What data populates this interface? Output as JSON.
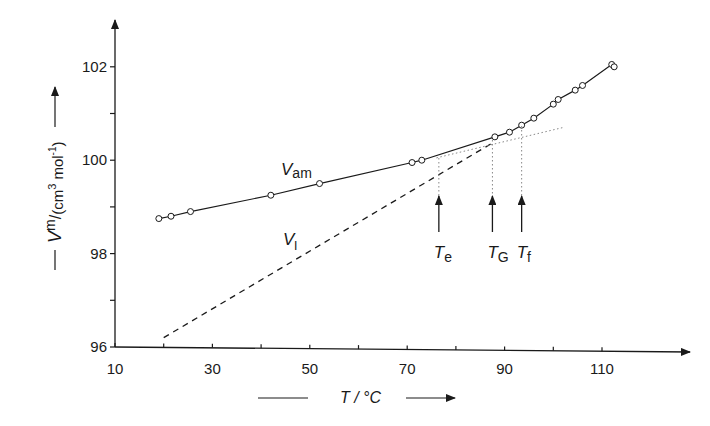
{
  "chart_data": {
    "type": "line",
    "title": "",
    "xlabel": "T / °C",
    "ylabel": "V m / (cm3 mol-1)",
    "xlim": [
      10,
      125
    ],
    "ylim": [
      96,
      103
    ],
    "x_ticks": [
      10,
      20,
      30,
      40,
      50,
      60,
      70,
      80,
      90,
      100,
      110
    ],
    "x_tick_labels": [
      "10",
      "30",
      "50",
      "70",
      "90",
      "110"
    ],
    "y_ticks": [
      96,
      97,
      98,
      99,
      100,
      101,
      102
    ],
    "y_tick_labels": [
      "96",
      "98",
      "100",
      "102"
    ],
    "grid": false,
    "series": [
      {
        "name": "V_am",
        "label": "V",
        "label_sub": "am",
        "style": "solid-with-markers",
        "x": [
          19,
          21.5,
          25.5,
          42,
          52,
          71,
          73,
          88,
          91,
          93.5,
          96,
          100,
          101,
          104.5,
          106,
          112,
          112.5
        ],
        "y": [
          98.75,
          98.8,
          98.9,
          99.25,
          99.5,
          99.95,
          100.0,
          100.5,
          100.6,
          100.75,
          100.9,
          101.2,
          101.3,
          101.5,
          101.6,
          102.05,
          102.0
        ]
      },
      {
        "name": "V_l",
        "label": "V",
        "label_sub": "l",
        "style": "dashed",
        "x": [
          20,
          88
        ],
        "y": [
          96.2,
          100.4
        ]
      },
      {
        "name": "glass-extrapolation",
        "style": "dotted",
        "x": [
          76,
          102
        ],
        "y": [
          100.05,
          100.7
        ]
      }
    ],
    "annotations": [
      {
        "label": "T",
        "sub": "e",
        "x": 76.5
      },
      {
        "label": "T",
        "sub": "G",
        "x": 87.5
      },
      {
        "label": "T",
        "sub": "f",
        "x": 93.5
      }
    ]
  },
  "axes": {
    "x_title": "T / °C",
    "y_title_main": "V",
    "y_title_sup": "m",
    "y_title_units": "(cm",
    "y_title_units_sup": "3",
    "y_title_units_end": " mol",
    "y_title_units_sup2": "-1",
    "y_title_close": ")"
  }
}
